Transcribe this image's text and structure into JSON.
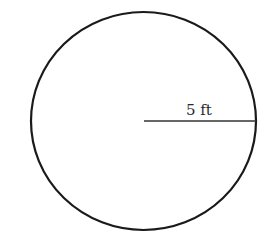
{
  "diagram": {
    "shape": "circle",
    "radius_label": "5 ft",
    "stroke_color": "#1a1a1a",
    "line_color": "#333333",
    "background": "#ffffff"
  }
}
